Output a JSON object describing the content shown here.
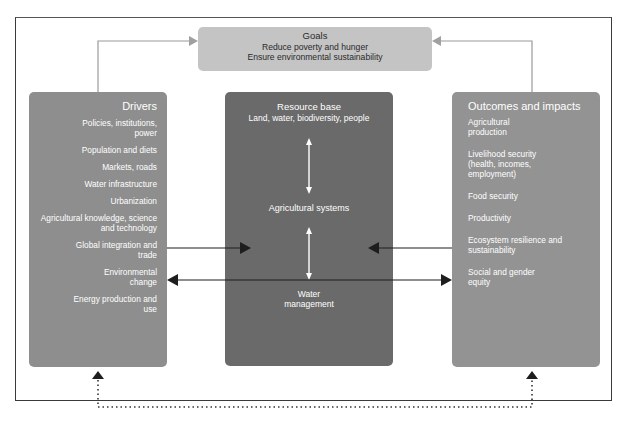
{
  "diagram": {
    "goals": {
      "title": "Goals",
      "lines": [
        "Reduce poverty and hunger",
        "Ensure environmental sustainability"
      ]
    },
    "drivers": {
      "title": "Drivers",
      "items": [
        "Policies, institutions, power",
        "Population and diets",
        "Markets, roads",
        "Water infrastructure",
        "Urbanization",
        "Agricultural knowledge, science and technology",
        "Global integration and trade",
        "Environmental change",
        "Energy production and use"
      ]
    },
    "resource": {
      "title": "Resource base",
      "subtitle": "Land, water, biodiversity, people",
      "middle": "Agricultural systems",
      "bottom_line1": "Water",
      "bottom_line2": "management"
    },
    "outcomes": {
      "title": "Outcomes and impacts",
      "items": [
        "Agricultural production",
        "Livelihood security (health, incomes, employment)",
        "Food security",
        "Productivity",
        "Ecosystem resilience and sustainability",
        "Social and gender equity"
      ]
    },
    "colors": {
      "goals_box": "#c4c4c4",
      "drivers_box": "#8e8e8e",
      "resource_box": "#6a6a6a",
      "outcomes_box": "#939393",
      "arrow_dark": "#1e1e1e",
      "arrow_goal": "#9a9a9a"
    }
  }
}
